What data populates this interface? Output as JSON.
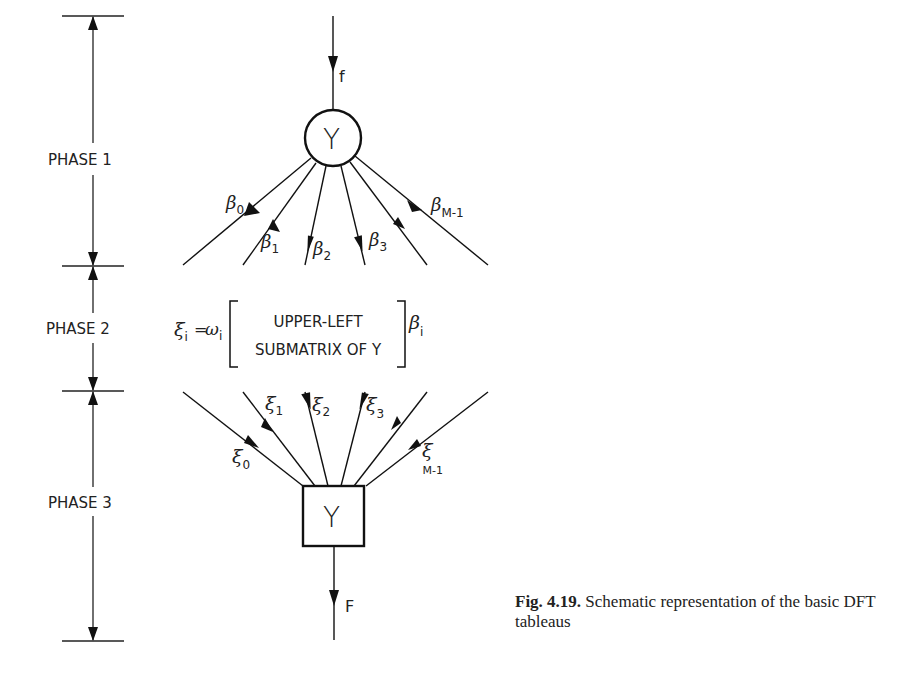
{
  "figure": {
    "caption_number": "Fig. 4.19.",
    "caption_text": "Schematic representation of the basic DFT tableaus"
  },
  "phases": [
    {
      "label": "PHASE 1"
    },
    {
      "label": "PHASE 2"
    },
    {
      "label": "PHASE 3"
    }
  ],
  "phase1": {
    "input_label": "f",
    "node_label": "Y",
    "node_shape": "circle",
    "outputs": [
      {
        "sym": "β",
        "sub": "0"
      },
      {
        "sym": "β",
        "sub": "1"
      },
      {
        "sym": "β",
        "sub": "2"
      },
      {
        "sym": "β",
        "sub": "3"
      },
      {
        "sym": "β",
        "sub": "M-1"
      }
    ]
  },
  "phase2": {
    "lhs": "ξ",
    "lhs_sub": "i",
    "eq": "=",
    "weight": "ω",
    "weight_sub": "i",
    "matrix_line1": "UPPER-LEFT",
    "matrix_line2": "SUBMATRIX OF Y",
    "rhs": "β",
    "rhs_sub": "i"
  },
  "phase3": {
    "node_label": "Y",
    "node_shape": "square",
    "output_label": "F",
    "inputs": [
      {
        "sym": "ξ",
        "sub": "0"
      },
      {
        "sym": "ξ",
        "sub": "1"
      },
      {
        "sym": "ξ",
        "sub": "2"
      },
      {
        "sym": "ξ",
        "sub": "3"
      },
      {
        "sym": "ξ",
        "sub": "M-1"
      }
    ]
  }
}
